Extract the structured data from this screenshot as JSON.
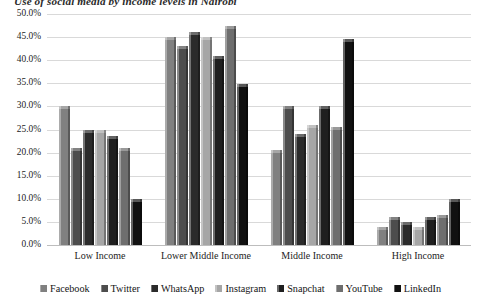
{
  "chart_data": {
    "type": "bar",
    "title": "Use of social media by income levels in Nairobi",
    "xlabel": "",
    "ylabel": "",
    "ylim": [
      0,
      50
    ],
    "ytick_labels": [
      "50.0%",
      "45.0%",
      "40.0%",
      "35.0%",
      "30.0%",
      "25.0%",
      "20.0%",
      "15.0%",
      "10.0%",
      "5.0%",
      "0.0%"
    ],
    "ytick_values": [
      50,
      45,
      40,
      35,
      30,
      25,
      20,
      15,
      10,
      5,
      0
    ],
    "grid": true,
    "legend_position": "bottom",
    "categories": [
      "Low Income",
      "Lower Middle Income",
      "Middle Income",
      "High Income"
    ],
    "series": [
      {
        "name": "Facebook",
        "color": "#808080",
        "values": [
          30.0,
          45.0,
          20.5,
          4.0
        ]
      },
      {
        "name": "Twitter",
        "color": "#4d4d4d",
        "values": [
          21.0,
          43.0,
          30.0,
          6.0
        ]
      },
      {
        "name": "WhatsApp",
        "color": "#2b2b2b",
        "values": [
          25.0,
          46.0,
          24.0,
          5.0
        ]
      },
      {
        "name": "Instagram",
        "color": "#a6a6a6",
        "values": [
          24.8,
          45.0,
          26.0,
          3.8
        ]
      },
      {
        "name": "Snapchat",
        "color": "#1f1f1f",
        "values": [
          23.5,
          41.0,
          30.0,
          6.0
        ]
      },
      {
        "name": "YouTube",
        "color": "#6e6e6e",
        "values": [
          21.0,
          47.5,
          25.5,
          6.5
        ]
      },
      {
        "name": "LinkedIn",
        "color": "#111111",
        "values": [
          10.0,
          34.8,
          44.5,
          10.0
        ]
      }
    ]
  }
}
